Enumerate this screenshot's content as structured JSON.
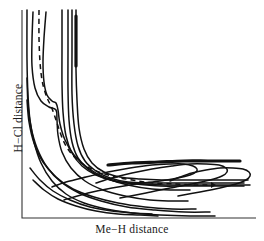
{
  "figure": {
    "kind": "potential-energy-surface-contour-plot",
    "background_color": "#ffffff",
    "line_color": "#111111",
    "dashed_color": "#111111"
  },
  "axes": {
    "x_label": "Me−H distance",
    "y_label": "H−Cl distance",
    "origin_px": [
      22,
      218
    ],
    "x_end_px": [
      256,
      218
    ],
    "y_top_px": [
      22,
      10
    ],
    "ticks": false,
    "grid": false
  },
  "chart_data": {
    "type": "line",
    "title": "",
    "xlabel": "Me−H distance",
    "ylabel": "H−Cl distance",
    "xlim": [
      22,
      256
    ],
    "ylim": [
      218,
      10
    ],
    "grid": false,
    "legend": false,
    "series": [
      {
        "name": "contour-1-outermost-entrance",
        "style": "solid",
        "points": [
          [
            27,
            10
          ],
          [
            27,
            60
          ],
          [
            28,
            95
          ],
          [
            30,
            120
          ],
          [
            34,
            142
          ],
          [
            41,
            163
          ],
          [
            52,
            181
          ],
          [
            66,
            194
          ],
          [
            84,
            203
          ],
          [
            106,
            209
          ],
          [
            132,
            213
          ],
          [
            160,
            215
          ],
          [
            190,
            216
          ],
          [
            215,
            216
          ]
        ]
      },
      {
        "name": "contour-2",
        "style": "solid",
        "points": [
          [
            27,
            78
          ],
          [
            28,
            104
          ],
          [
            31,
            127
          ],
          [
            37,
            148
          ],
          [
            47,
            167
          ],
          [
            61,
            182
          ],
          [
            79,
            193
          ],
          [
            101,
            201
          ],
          [
            127,
            207
          ],
          [
            155,
            210
          ],
          [
            185,
            212
          ],
          [
            210,
            212
          ]
        ]
      },
      {
        "name": "contour-3",
        "style": "solid",
        "points": [
          [
            27,
            100
          ],
          [
            29,
            122
          ],
          [
            34,
            143
          ],
          [
            43,
            162
          ],
          [
            56,
            177
          ],
          [
            73,
            189
          ],
          [
            94,
            197
          ],
          [
            118,
            203
          ],
          [
            145,
            207
          ],
          [
            172,
            209
          ],
          [
            196,
            209
          ]
        ]
      },
      {
        "name": "contour-4-valley-u-left",
        "style": "solid",
        "points": [
          [
            33,
            12
          ],
          [
            32,
            40
          ],
          [
            32,
            66
          ],
          [
            35,
            88
          ],
          [
            41,
            101
          ],
          [
            49,
            107
          ],
          [
            56,
            110
          ],
          [
            57,
            120
          ],
          [
            58,
            135
          ],
          [
            62,
            152
          ],
          [
            71,
            168
          ],
          [
            85,
            181
          ],
          [
            103,
            190
          ],
          [
            125,
            196
          ],
          [
            150,
            200
          ],
          [
            172,
            201
          ],
          [
            188,
            201
          ]
        ]
      },
      {
        "name": "contour-5-inner-u-entrance",
        "style": "solid",
        "points": [
          [
            46,
            12
          ],
          [
            44,
            38
          ],
          [
            43,
            62
          ],
          [
            44,
            82
          ],
          [
            47,
            95
          ],
          [
            52,
            101
          ],
          [
            56,
            103
          ],
          [
            58,
            110
          ],
          [
            60,
            124
          ],
          [
            65,
            140
          ],
          [
            74,
            155
          ],
          [
            88,
            168
          ],
          [
            106,
            178
          ],
          [
            128,
            185
          ],
          [
            152,
            189
          ],
          [
            174,
            190
          ],
          [
            190,
            190
          ]
        ]
      },
      {
        "name": "contour-6-elbow-outer",
        "style": "solid",
        "points": [
          [
            62,
            10
          ],
          [
            62,
            48
          ],
          [
            62,
            84
          ],
          [
            63,
            112
          ],
          [
            66,
            136
          ],
          [
            72,
            153
          ],
          [
            82,
            166
          ],
          [
            96,
            175
          ],
          [
            114,
            181
          ],
          [
            136,
            184
          ],
          [
            160,
            186
          ],
          [
            185,
            186
          ],
          [
            210,
            186
          ],
          [
            232,
            186
          ],
          [
            244,
            186
          ]
        ]
      },
      {
        "name": "contour-7-elbow",
        "style": "solid",
        "points": [
          [
            68,
            10
          ],
          [
            68,
            50
          ],
          [
            68,
            90
          ],
          [
            69,
            120
          ],
          [
            72,
            142
          ],
          [
            78,
            158
          ],
          [
            88,
            169
          ],
          [
            102,
            177
          ],
          [
            120,
            182
          ],
          [
            142,
            184
          ],
          [
            166,
            185
          ],
          [
            192,
            185
          ],
          [
            218,
            185
          ],
          [
            240,
            185
          ],
          [
            250,
            185
          ]
        ]
      },
      {
        "name": "contour-8-elbow-inner",
        "style": "solid",
        "points": [
          [
            72,
            10
          ],
          [
            72,
            52
          ],
          [
            72,
            94
          ],
          [
            74,
            124
          ],
          [
            78,
            146
          ],
          [
            85,
            161
          ],
          [
            96,
            171
          ],
          [
            110,
            178
          ],
          [
            128,
            182
          ],
          [
            150,
            183
          ],
          [
            174,
            183
          ],
          [
            200,
            183
          ],
          [
            224,
            183
          ],
          [
            244,
            183
          ]
        ]
      },
      {
        "name": "contour-9-elbow-innermost",
        "style": "solid",
        "points": [
          [
            76,
            10
          ],
          [
            76,
            40
          ],
          [
            76,
            70
          ],
          [
            77,
            100
          ],
          [
            79,
            128
          ],
          [
            84,
            149
          ],
          [
            92,
            163
          ],
          [
            104,
            172
          ],
          [
            120,
            177
          ],
          [
            140,
            179
          ],
          [
            162,
            180
          ],
          [
            186,
            180
          ],
          [
            210,
            180
          ],
          [
            232,
            180
          ],
          [
            248,
            180
          ]
        ]
      },
      {
        "name": "contour-10-exit-u-outer",
        "style": "solid",
        "points": [
          [
            64,
            200
          ],
          [
            88,
            193
          ],
          [
            112,
            188
          ],
          [
            136,
            184
          ],
          [
            160,
            181
          ],
          [
            178,
            178
          ],
          [
            190,
            175
          ],
          [
            196,
            172
          ],
          [
            197,
            169
          ],
          [
            193,
            166
          ],
          [
            184,
            164
          ],
          [
            170,
            164
          ],
          [
            152,
            165
          ],
          [
            130,
            168
          ],
          [
            108,
            172
          ],
          [
            86,
            177
          ],
          [
            66,
            182
          ],
          [
            52,
            187
          ]
        ]
      },
      {
        "name": "contour-11-exit-u-middle",
        "style": "solid",
        "points": [
          [
            120,
            198
          ],
          [
            146,
            193
          ],
          [
            170,
            188
          ],
          [
            192,
            184
          ],
          [
            210,
            180
          ],
          [
            222,
            176
          ],
          [
            227,
            172
          ],
          [
            226,
            168
          ],
          [
            219,
            165
          ],
          [
            206,
            164
          ],
          [
            190,
            164
          ],
          [
            172,
            166
          ],
          [
            152,
            169
          ],
          [
            132,
            173
          ],
          [
            112,
            178
          ],
          [
            96,
            183
          ]
        ]
      },
      {
        "name": "contour-12-exit-u-inner",
        "style": "solid",
        "points": [
          [
            178,
            196
          ],
          [
            200,
            192
          ],
          [
            220,
            188
          ],
          [
            236,
            184
          ],
          [
            246,
            180
          ],
          [
            250,
            176
          ],
          [
            249,
            172
          ],
          [
            243,
            169
          ],
          [
            233,
            168
          ],
          [
            220,
            168
          ],
          [
            206,
            170
          ],
          [
            192,
            173
          ],
          [
            180,
            177
          ],
          [
            170,
            181
          ]
        ]
      },
      {
        "name": "contour-13-bottom-sweep-a",
        "style": "solid",
        "points": [
          [
            33,
            180
          ],
          [
            44,
            190
          ],
          [
            58,
            199
          ],
          [
            76,
            206
          ],
          [
            96,
            211
          ],
          [
            118,
            214
          ],
          [
            140,
            215
          ],
          [
            158,
            216
          ]
        ]
      },
      {
        "name": "contour-14-bottom-sweep-b",
        "style": "solid",
        "points": [
          [
            30,
            168
          ],
          [
            40,
            180
          ],
          [
            53,
            191
          ],
          [
            70,
            200
          ],
          [
            90,
            207
          ],
          [
            112,
            211
          ],
          [
            134,
            213
          ],
          [
            152,
            214
          ]
        ]
      },
      {
        "name": "thick-band-upper",
        "style": "solid-thick",
        "points": [
          [
            108,
            165
          ],
          [
            132,
            163
          ],
          [
            158,
            162
          ],
          [
            184,
            161
          ],
          [
            208,
            161
          ],
          [
            228,
            161
          ],
          [
            240,
            161
          ]
        ]
      },
      {
        "name": "thick-band-vertical-entrance",
        "style": "solid-thick",
        "points": [
          [
            76,
            16
          ],
          [
            76,
            36
          ],
          [
            76,
            54
          ],
          [
            76,
            66
          ]
        ]
      }
    ],
    "reaction_path": {
      "name": "minimum-energy-path",
      "style": "dashed",
      "dash_pattern": [
        5,
        4
      ],
      "points": [
        [
          39,
          10
        ],
        [
          39,
          38
        ],
        [
          40,
          62
        ],
        [
          42,
          80
        ],
        [
          45,
          92
        ],
        [
          48,
          100
        ],
        [
          51,
          106
        ],
        [
          54,
          114
        ],
        [
          58,
          126
        ],
        [
          63,
          140
        ],
        [
          70,
          152
        ],
        [
          80,
          162
        ],
        [
          94,
          170
        ],
        [
          112,
          176
        ],
        [
          132,
          180
        ],
        [
          154,
          183
        ],
        [
          176,
          184
        ],
        [
          196,
          185
        ],
        [
          210,
          185
        ]
      ],
      "arrow_tip_px": [
        216,
        185
      ],
      "arrow_direction": "right"
    }
  }
}
